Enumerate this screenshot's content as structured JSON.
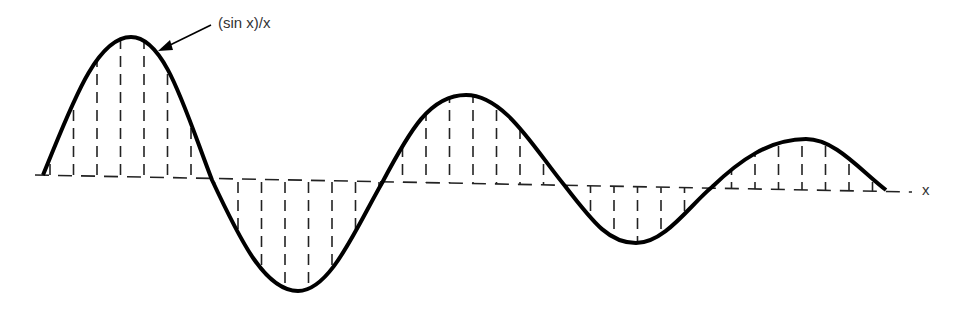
{
  "figure": {
    "curve_label": "(sin x)/x",
    "axis_label": "x",
    "curve_color": "#000000",
    "hatch_color": "#222222"
  },
  "chart_data": {
    "type": "line",
    "title": "",
    "series": [
      {
        "name": "(sin x)/x",
        "note": "damped oscillation with vertically hatched area between curve and x-axis"
      }
    ],
    "xlabel": "x",
    "ylabel": "",
    "annotations": [
      "(sin x)/x"
    ],
    "extrema_px": [
      [
        131,
        37
      ],
      [
        298,
        291
      ],
      [
        466,
        95
      ],
      [
        636,
        243
      ],
      [
        806,
        139
      ]
    ],
    "zero_crossings_px": [
      [
        43,
        175
      ],
      [
        212,
        180
      ],
      [
        382,
        183
      ],
      [
        565,
        186
      ],
      [
        712,
        187
      ],
      [
        886,
        190
      ]
    ],
    "grid": false
  }
}
